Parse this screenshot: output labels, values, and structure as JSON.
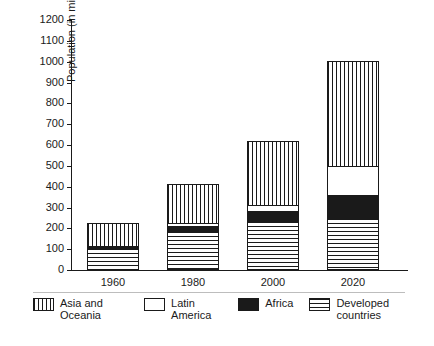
{
  "chart_data": {
    "type": "bar",
    "stacked": true,
    "title": "",
    "xlabel": "",
    "ylabel": "Population (in millions)",
    "categories": [
      "1960",
      "1980",
      "2000",
      "2020"
    ],
    "ylim": [
      0,
      1200
    ],
    "ytick_values": [
      0,
      100,
      200,
      300,
      400,
      500,
      600,
      700,
      800,
      900,
      1000,
      1100,
      1200
    ],
    "ytick_labels": [
      "0",
      "100",
      "200",
      "300",
      "400",
      "500",
      "600",
      "700",
      "800",
      "900",
      "1000",
      "1100",
      "1200"
    ],
    "grid": false,
    "legend_position": "bottom",
    "series": [
      {
        "name": "Asia and Oceania",
        "pattern": "vertical-stripes",
        "values": [
          110,
          190,
          310,
          505
        ]
      },
      {
        "name": "Latin America",
        "pattern": "white-blank",
        "values": [
          0,
          15,
          25,
          140
        ]
      },
      {
        "name": "Africa",
        "pattern": "solid-black",
        "values": [
          10,
          25,
          50,
          110
        ]
      },
      {
        "name": "Developed countries",
        "pattern": "horizontal-stripes",
        "values": [
          105,
          185,
          235,
          250
        ]
      }
    ],
    "totals": [
      225,
      415,
      620,
      1005
    ],
    "annotations": []
  },
  "axis": {
    "y_title": "Population (in millions)"
  },
  "legend": {
    "items": [
      {
        "label": "Asia and Oceania",
        "icon": "vertical-stripe-swatch"
      },
      {
        "label": "Latin America",
        "icon": "blank-swatch"
      },
      {
        "label": "Africa",
        "icon": "solid-black-swatch"
      },
      {
        "label": "Developed\ncountries",
        "icon": "horizontal-stripe-swatch"
      }
    ]
  },
  "caption": {
    "text": ""
  }
}
